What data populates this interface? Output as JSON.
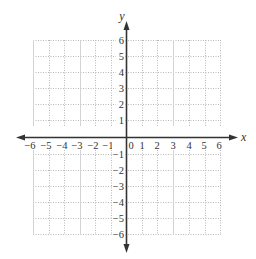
{
  "diagram": {
    "type": "cartesian-coordinate-grid",
    "x_axis": {
      "label": "x",
      "min": -6,
      "max": 6,
      "ticks": [
        "−6",
        "−5",
        "−4",
        "−3",
        "−2",
        "−1",
        "0",
        "1",
        "2",
        "3",
        "4",
        "5",
        "6"
      ]
    },
    "y_axis": {
      "label": "y",
      "min": -6,
      "max": 6,
      "ticks_positive": [
        "6",
        "5",
        "4",
        "3",
        "2",
        "1"
      ],
      "ticks_negative": [
        "−1",
        "−2",
        "−3",
        "−4",
        "−5",
        "−6"
      ]
    },
    "colors": {
      "axis": "#333333",
      "grid_solid": "#d9d9d9",
      "grid_dotted": "#b5b5b5",
      "background": "#ffffff"
    }
  }
}
